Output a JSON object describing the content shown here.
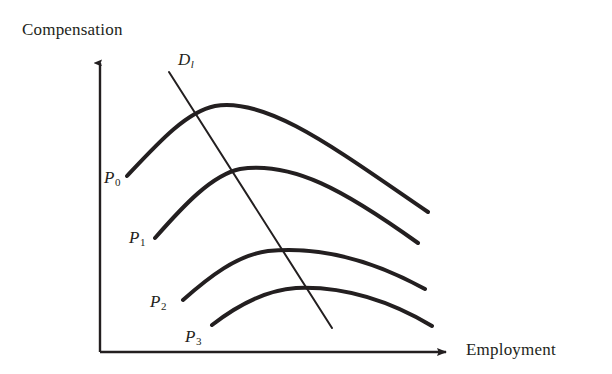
{
  "figure": {
    "kind": "economics-diagram",
    "background_color": "#ffffff",
    "ink_color": "#231f20"
  },
  "axes": {
    "y_label": "Compensation",
    "x_label": "Employment",
    "origin": {
      "x": 100,
      "y": 352
    },
    "y_axis_tip": {
      "x": 100,
      "y": 57
    },
    "x_axis_tip": {
      "x": 452,
      "y": 352
    },
    "arrowheads": true
  },
  "labels": {
    "p0": {
      "text": "P",
      "sub": "0"
    },
    "p1": {
      "text": "P",
      "sub": "1"
    },
    "p2": {
      "text": "P",
      "sub": "2"
    },
    "p3": {
      "text": "P",
      "sub": "3"
    },
    "demand": {
      "text": "D",
      "sub": "l"
    }
  },
  "chart_data": {
    "type": "line",
    "title": "",
    "xlabel": "Employment",
    "ylabel": "Compensation",
    "grid": false,
    "legend": "none",
    "axis_ticks": "none",
    "note": "Four concave isoprofit curves P0..P3 of decreasing compensation level, crossed by a downward-sloping labor demand line D_l.",
    "series": [
      {
        "name": "P0",
        "label": "P₀",
        "kind": "isoprofit-curve",
        "shape": "concave-down",
        "stroke_width": 4,
        "path": "M 127 176 C 158 143 186 112 215 106 C 268 97 337 150 428 212",
        "start_point": {
          "x": 127,
          "y": 176
        },
        "peak_point": {
          "x": 215,
          "y": 106
        },
        "end_point": {
          "x": 428,
          "y": 212
        }
      },
      {
        "name": "P1",
        "label": "P₁",
        "kind": "isoprofit-curve",
        "shape": "concave-down",
        "stroke_width": 4,
        "path": "M 155 238 C 184 205 212 175 240 169 C 292 161 344 190 418 243",
        "start_point": {
          "x": 155,
          "y": 238
        },
        "peak_point": {
          "x": 240,
          "y": 169
        },
        "end_point": {
          "x": 418,
          "y": 243
        }
      },
      {
        "name": "P2",
        "label": "P₂",
        "kind": "isoprofit-curve",
        "shape": "concave-down",
        "stroke_width": 4,
        "path": "M 183 300 C 209 277 237 255 268 251 C 318 246 372 260 425 289",
        "start_point": {
          "x": 183,
          "y": 300
        },
        "peak_point": {
          "x": 268,
          "y": 251
        },
        "end_point": {
          "x": 425,
          "y": 289
        }
      },
      {
        "name": "P3",
        "label": "P₃",
        "kind": "isoprofit-curve",
        "shape": "concave-down",
        "stroke_width": 4,
        "path": "M 212 325 C 238 305 266 290 296 288 C 344 286 390 301 432 326",
        "start_point": {
          "x": 212,
          "y": 325
        },
        "peak_point": {
          "x": 296,
          "y": 288
        },
        "end_point": {
          "x": 432,
          "y": 326
        }
      },
      {
        "name": "Dl",
        "label": "D_l",
        "kind": "demand-line",
        "shape": "straight-downward-sloping",
        "stroke_width": 2,
        "path": "M 169 72 L 332 328",
        "start_point": {
          "x": 169,
          "y": 72
        },
        "end_point": {
          "x": 332,
          "y": 328
        }
      }
    ]
  }
}
